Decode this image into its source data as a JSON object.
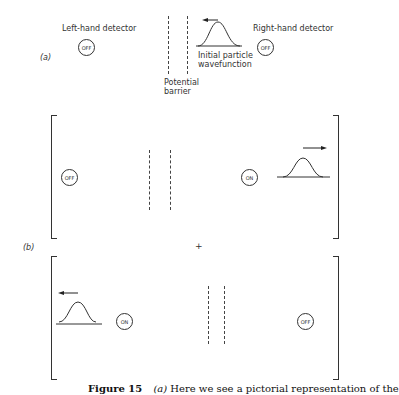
{
  "panel_a": {
    "label": "(a)",
    "left_detector_label": "Left-hand detector",
    "right_detector_label": "Right-hand detector",
    "left_detector_state": "OFF",
    "right_detector_state": "OFF",
    "barrier_label_1": "Potential",
    "barrier_label_2": "barrier",
    "wave_label_1": "Initial particle",
    "wave_label_2": "wavefunction",
    "wave_direction": "left"
  },
  "panel_b": {
    "label": "(b)",
    "plus": "+",
    "top": {
      "left_detector_state": "OFF",
      "right_detector_state": "ON",
      "wave_position": "right",
      "wave_direction": "right"
    },
    "bottom": {
      "left_detector_state": "ON",
      "right_detector_state": "OFF",
      "wave_position": "left",
      "wave_direction": "left"
    }
  },
  "caption": {
    "figure": "Figure 15",
    "label": "(a)",
    "text": "Here we see a pictorial representation of the"
  }
}
